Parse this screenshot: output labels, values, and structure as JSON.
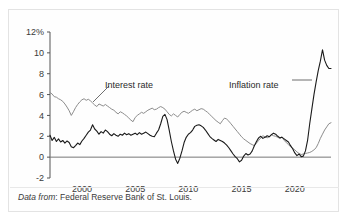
{
  "figure": {
    "caption_emphasis": "Data from",
    "caption_rest": ": Federal Reserve Bank of St. Louis."
  },
  "axes": {
    "y_ticks": [
      "12%",
      "10",
      "8",
      "6",
      "4",
      "2",
      "0",
      "-2"
    ],
    "x_ticks": [
      "2000",
      "2005",
      "2010",
      "2015",
      "2020"
    ]
  },
  "annotations": {
    "interest": "Interest rate",
    "inflation": "Inflation rate"
  },
  "colors": {
    "interest_line": "#8c8c8c",
    "inflation_line": "#1a1a1a",
    "axis": "#555555",
    "zero_line": "#777777",
    "frame": "#e3e3e3"
  },
  "chart_data": {
    "type": "line",
    "title": "",
    "xlabel": "",
    "ylabel": "",
    "xlim": [
      1997.0,
      2023.4
    ],
    "ylim": [
      -2,
      12
    ],
    "ytick_values": [
      12,
      10,
      8,
      6,
      4,
      2,
      0,
      -2
    ],
    "xtick_values": [
      2000,
      2005,
      2010,
      2015,
      2020
    ],
    "grid": false,
    "legend": "inline-annotations",
    "units": "percent",
    "zero_reference_line": 0,
    "series": [
      {
        "name": "Interest rate",
        "color": "#8c8c8c",
        "x": [
          1997.0,
          1997.2,
          1997.4,
          1997.6,
          1997.8,
          1998.0,
          1998.2,
          1998.4,
          1998.6,
          1998.8,
          1999.0,
          1999.2,
          1999.4,
          1999.6,
          1999.8,
          2000.0,
          2000.2,
          2000.4,
          2000.6,
          2000.8,
          2001.0,
          2001.2,
          2001.4,
          2001.6,
          2001.8,
          2002.0,
          2002.2,
          2002.4,
          2002.6,
          2002.8,
          2003.0,
          2003.2,
          2003.4,
          2003.6,
          2003.8,
          2004.0,
          2004.2,
          2004.4,
          2004.6,
          2004.8,
          2005.0,
          2005.2,
          2005.4,
          2005.6,
          2005.8,
          2006.0,
          2006.2,
          2006.4,
          2006.6,
          2006.8,
          2007.0,
          2007.2,
          2007.4,
          2007.6,
          2007.8,
          2008.0,
          2008.2,
          2008.4,
          2008.6,
          2008.8,
          2009.0,
          2009.2,
          2009.4,
          2009.6,
          2009.8,
          2010.0,
          2010.2,
          2010.4,
          2010.6,
          2010.8,
          2011.0,
          2011.2,
          2011.4,
          2011.6,
          2011.8,
          2012.0,
          2012.2,
          2012.4,
          2012.6,
          2012.8,
          2013.0,
          2013.2,
          2013.4,
          2013.6,
          2013.8,
          2014.0,
          2014.2,
          2014.4,
          2014.6,
          2014.8,
          2015.0,
          2015.2,
          2015.4,
          2015.6,
          2015.8,
          2016.0,
          2016.2,
          2016.4,
          2016.6,
          2016.8,
          2017.0,
          2017.2,
          2017.4,
          2017.6,
          2017.8,
          2018.0,
          2018.2,
          2018.4,
          2018.6,
          2018.8,
          2019.0,
          2019.2,
          2019.4,
          2019.6,
          2019.8,
          2020.0,
          2020.2,
          2020.4,
          2020.6,
          2020.8,
          2021.0,
          2021.2,
          2021.4,
          2021.6,
          2021.8,
          2022.0,
          2022.2,
          2022.4,
          2022.6,
          2022.8,
          2023.0,
          2023.2,
          2023.4
        ],
        "y": [
          6.2,
          6.05,
          5.8,
          5.75,
          5.6,
          5.5,
          5.35,
          5.1,
          4.8,
          4.45,
          4.0,
          4.35,
          4.75,
          5.05,
          5.3,
          5.5,
          5.6,
          5.45,
          5.55,
          5.4,
          5.2,
          5.0,
          4.85,
          5.1,
          5.0,
          4.9,
          5.05,
          4.9,
          4.75,
          4.6,
          4.5,
          4.3,
          4.15,
          4.35,
          4.25,
          4.1,
          3.95,
          3.75,
          3.55,
          3.4,
          3.8,
          4.0,
          4.15,
          4.3,
          4.2,
          4.35,
          4.5,
          4.6,
          4.7,
          4.55,
          4.6,
          4.75,
          4.85,
          4.75,
          4.6,
          4.35,
          4.1,
          3.95,
          4.15,
          4.0,
          3.85,
          4.1,
          4.3,
          4.4,
          4.3,
          4.2,
          4.35,
          4.5,
          4.6,
          4.45,
          4.55,
          4.65,
          4.6,
          4.45,
          4.3,
          4.1,
          3.9,
          3.7,
          3.5,
          3.35,
          3.2,
          3.5,
          3.75,
          3.65,
          3.45,
          3.2,
          2.95,
          2.7,
          2.45,
          2.2,
          1.95,
          1.75,
          1.6,
          1.45,
          1.3,
          1.2,
          1.1,
          1.35,
          1.6,
          1.85,
          2.05,
          1.95,
          1.85,
          1.95,
          2.15,
          2.05,
          2.0,
          1.9,
          1.8,
          1.95,
          1.6,
          1.4,
          1.2,
          1.0,
          0.85,
          0.7,
          0.5,
          0.35,
          0.25,
          0.3,
          0.35,
          0.4,
          0.45,
          0.55,
          0.7,
          0.9,
          1.3,
          1.8,
          2.2,
          2.6,
          2.9,
          3.2,
          3.3
        ]
      },
      {
        "name": "Inflation rate",
        "color": "#1a1a1a",
        "x": [
          1997.0,
          1997.2,
          1997.4,
          1997.6,
          1997.8,
          1998.0,
          1998.2,
          1998.4,
          1998.6,
          1998.8,
          1999.0,
          1999.2,
          1999.4,
          1999.6,
          1999.8,
          2000.0,
          2000.2,
          2000.4,
          2000.6,
          2000.8,
          2001.0,
          2001.2,
          2001.4,
          2001.6,
          2001.8,
          2002.0,
          2002.2,
          2002.4,
          2002.6,
          2002.8,
          2003.0,
          2003.2,
          2003.4,
          2003.6,
          2003.8,
          2004.0,
          2004.2,
          2004.4,
          2004.6,
          2004.8,
          2005.0,
          2005.2,
          2005.4,
          2005.6,
          2005.8,
          2006.0,
          2006.2,
          2006.4,
          2006.6,
          2006.8,
          2007.0,
          2007.2,
          2007.4,
          2007.6,
          2007.8,
          2008.0,
          2008.2,
          2008.4,
          2008.6,
          2008.8,
          2009.0,
          2009.2,
          2009.4,
          2009.6,
          2009.8,
          2010.0,
          2010.2,
          2010.4,
          2010.6,
          2010.8,
          2011.0,
          2011.2,
          2011.4,
          2011.6,
          2011.8,
          2012.0,
          2012.2,
          2012.4,
          2012.6,
          2012.8,
          2013.0,
          2013.2,
          2013.4,
          2013.6,
          2013.8,
          2014.0,
          2014.2,
          2014.4,
          2014.6,
          2014.8,
          2015.0,
          2015.2,
          2015.4,
          2015.6,
          2015.8,
          2016.0,
          2016.2,
          2016.4,
          2016.6,
          2016.8,
          2017.0,
          2017.2,
          2017.4,
          2017.6,
          2017.8,
          2018.0,
          2018.2,
          2018.4,
          2018.6,
          2018.8,
          2019.0,
          2019.2,
          2019.4,
          2019.6,
          2019.8,
          2020.0,
          2020.2,
          2020.4,
          2020.6,
          2020.8,
          2021.0,
          2021.2,
          2021.4,
          2021.6,
          2021.8,
          2022.0,
          2022.2,
          2022.4,
          2022.6,
          2022.8,
          2023.0,
          2023.2,
          2023.4
        ],
        "y": [
          2.1,
          1.6,
          1.9,
          1.5,
          1.75,
          1.45,
          1.6,
          1.35,
          1.55,
          1.4,
          1.0,
          0.9,
          1.1,
          1.35,
          1.2,
          1.55,
          1.8,
          2.1,
          2.4,
          2.6,
          3.1,
          2.7,
          2.5,
          2.2,
          2.45,
          2.3,
          2.6,
          2.45,
          2.2,
          2.05,
          2.25,
          2.1,
          2.0,
          2.2,
          2.1,
          2.3,
          2.15,
          2.25,
          2.1,
          2.2,
          2.3,
          2.15,
          2.35,
          2.2,
          2.3,
          2.4,
          2.25,
          2.1,
          2.0,
          1.95,
          2.3,
          2.6,
          3.2,
          3.9,
          4.1,
          3.6,
          2.6,
          1.5,
          0.6,
          -0.2,
          -0.6,
          -0.1,
          0.6,
          1.4,
          1.9,
          2.2,
          2.35,
          2.6,
          2.95,
          3.05,
          3.1,
          3.0,
          2.85,
          2.6,
          2.3,
          2.0,
          1.8,
          1.65,
          1.5,
          1.7,
          1.6,
          1.5,
          1.35,
          1.15,
          0.9,
          0.6,
          0.3,
          0.05,
          -0.15,
          -0.45,
          -0.3,
          0.1,
          0.35,
          0.2,
          0.3,
          0.6,
          1.1,
          1.5,
          1.85,
          2.0,
          1.8,
          1.9,
          2.05,
          1.95,
          2.15,
          2.3,
          2.2,
          2.0,
          1.85,
          1.9,
          1.75,
          1.6,
          1.45,
          1.1,
          0.8,
          0.4,
          0.15,
          0.3,
          0.05,
          0.1,
          0.6,
          1.6,
          3.2,
          4.6,
          6.0,
          7.2,
          8.3,
          9.2,
          10.3,
          9.3,
          8.8,
          8.5,
          8.5
        ]
      }
    ]
  }
}
